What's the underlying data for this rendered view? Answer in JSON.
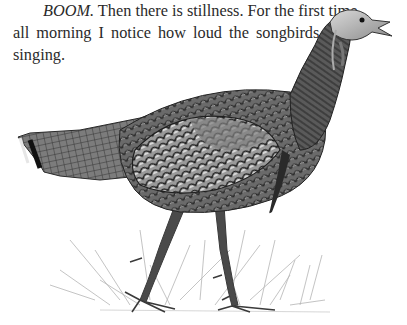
{
  "document": {
    "paragraph": {
      "lines": [
        {
          "italic_lead": "BOOM.",
          "text": " Then there is stillness. For the first time"
        },
        {
          "text": "all morning I notice how loud the songbirds are"
        },
        {
          "text": "singing."
        }
      ]
    },
    "illustration": {
      "subject": "wild-turkey-illustration",
      "description": "Pencil/engraving style drawing of a wild turkey walking through grass"
    }
  }
}
